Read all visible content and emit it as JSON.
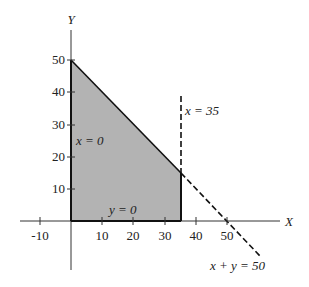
{
  "diagram": {
    "axes": {
      "x_label": "X",
      "y_label": "Y",
      "x_ticks": [
        {
          "value": -10,
          "label": "-10"
        },
        {
          "value": 10,
          "label": "10"
        },
        {
          "value": 20,
          "label": "20"
        },
        {
          "value": 30,
          "label": "30"
        },
        {
          "value": 40,
          "label": "40"
        },
        {
          "value": 50,
          "label": "50"
        }
      ],
      "y_ticks": [
        {
          "value": 10,
          "label": "10"
        },
        {
          "value": 20,
          "label": "20"
        },
        {
          "value": 30,
          "label": "30"
        },
        {
          "value": 40,
          "label": "40"
        },
        {
          "value": 50,
          "label": "50"
        }
      ]
    },
    "constraints": {
      "x_zero": "x = 0",
      "y_zero": "y = 0",
      "x_35": "x = 35",
      "sum_50": "x + y = 50"
    },
    "feasible_region": {
      "vertices": [
        [
          0,
          0
        ],
        [
          0,
          50
        ],
        [
          35,
          15
        ],
        [
          35,
          0
        ]
      ],
      "fill": "#b3b3b3"
    }
  }
}
